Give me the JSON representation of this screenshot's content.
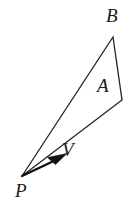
{
  "figure": {
    "type": "geometry-diagram",
    "background_color": "#ffffff",
    "stroke_color": "#232323",
    "labels": {
      "B": "B",
      "A": "A",
      "P": "P",
      "V": "V"
    },
    "points": {
      "P": {
        "x": 22,
        "y": 176
      },
      "B": {
        "x": 113,
        "y": 37
      },
      "C": {
        "x": 122,
        "y": 100
      },
      "V_tip": {
        "x": 65,
        "y": 155
      }
    },
    "triangle_path": "M 22 176 L 113 37 L 122 100 Z",
    "vector_line": {
      "x1": 22,
      "y1": 176,
      "x2": 60,
      "y2": 158
    },
    "arrowhead_path": "M 66 154 L 50 158 L 56 163 Z",
    "stroke_width": 1.3
  }
}
